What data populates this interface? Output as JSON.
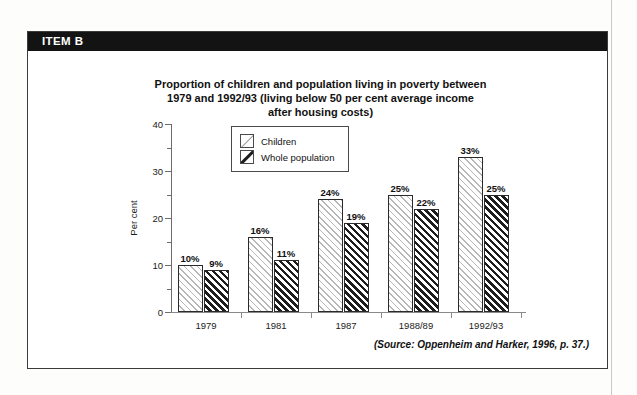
{
  "item": {
    "banner_label": "ITEM B"
  },
  "chart_data": {
    "type": "bar",
    "title": "Proportion of children and population living in poverty between 1979 and 1992/93 (living below 50 per cent average income after housing costs)",
    "title_lines": [
      "Proportion of children and population living in poverty between",
      "1979 and 1992/93 (living below 50 per cent average income",
      "after housing costs)"
    ],
    "categories": [
      "1979",
      "1981",
      "1987",
      "1988/89",
      "1992/93"
    ],
    "series": [
      {
        "name": "Children",
        "values": [
          10,
          16,
          24,
          25,
          33
        ],
        "labels": [
          "10%",
          "16%",
          "24%",
          "25%",
          "33%"
        ],
        "pattern": "light-diagonal-hatch"
      },
      {
        "name": "Whole population",
        "values": [
          9,
          11,
          19,
          22,
          25
        ],
        "labels": [
          "9%",
          "11%",
          "19%",
          "22%",
          "25%"
        ],
        "pattern": "dense-black-diagonal-hatch"
      }
    ],
    "xlabel": "",
    "ylabel": "Per cent",
    "ylim": [
      0,
      40
    ],
    "yticks": [
      0,
      10,
      20,
      30,
      40
    ],
    "ytick_labels": [
      "0",
      "10",
      "20",
      "30",
      "40"
    ],
    "yminor_ticks": [
      5,
      15,
      25,
      35
    ],
    "grid": false,
    "legend_position": "top-left-inside",
    "legend_entries": [
      "Children",
      "Whole population"
    ]
  },
  "source": {
    "text": "(Source: Oppenheim and Harker, 1996, p. 37.)"
  },
  "colors": {
    "banner_background": "#131313",
    "banner_text": "#ffffff",
    "box_border": "#3b3b3b",
    "children_hatch": "#b6b6b6",
    "whole_population_hatch": "#1d1d1d",
    "axis": "#6d6d6d"
  }
}
